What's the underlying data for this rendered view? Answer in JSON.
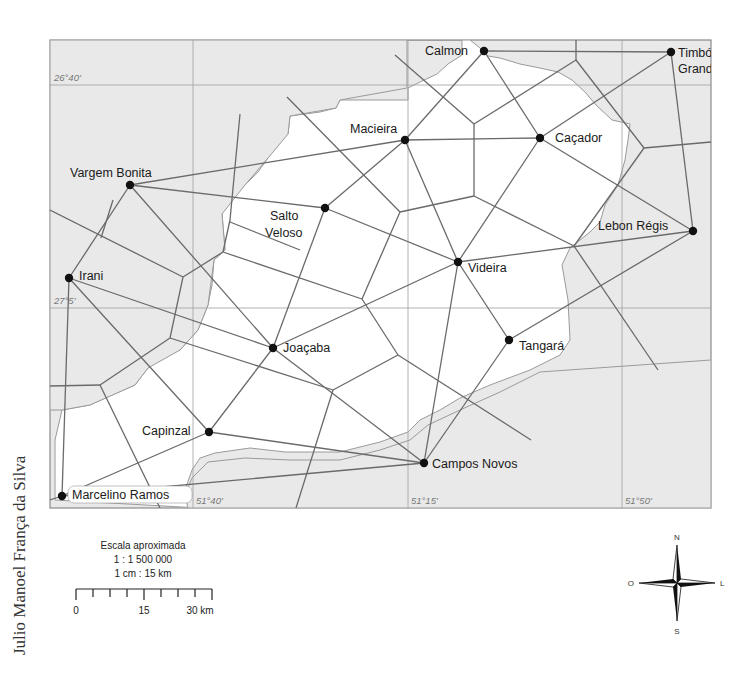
{
  "figure": {
    "top_fragment": "●",
    "author": "Julio Manoel França da Silva"
  },
  "map": {
    "colors": {
      "outside_region": "#e9e9e9",
      "inside_region": "#ffffff",
      "lines": "#6a6a6a",
      "grid": "#9a9a9a",
      "city_dot": "#111111"
    },
    "grid_labels": {
      "lat_top": "26°40'",
      "lat_mid": "27°5'",
      "lon_left": "51°40'",
      "lon_mid": "51°15'",
      "lon_right": "51°50'"
    },
    "cities": [
      {
        "name": "Calmon",
        "label": "Calmon"
      },
      {
        "name": "Timbó Grande",
        "label_line1": "Timbó",
        "label_line2": "Grande"
      },
      {
        "name": "Macieira",
        "label": "Macieira"
      },
      {
        "name": "Caçador",
        "label": "Caçador"
      },
      {
        "name": "Vargem Bonita",
        "label": "Vargem Bonita"
      },
      {
        "name": "Salto Veloso",
        "label_line1": "Salto",
        "label_line2": "Veloso"
      },
      {
        "name": "Lebon Régis",
        "label": "Lebon Régis"
      },
      {
        "name": "Videira",
        "label": "Videira"
      },
      {
        "name": "Irani",
        "label": "Irani"
      },
      {
        "name": "Joaçaba",
        "label": "Joaçaba"
      },
      {
        "name": "Tangará",
        "label": "Tangará"
      },
      {
        "name": "Capinzal",
        "label": "Capinzal"
      },
      {
        "name": "Campos Novos",
        "label": "Campos Novos"
      },
      {
        "name": "Marcelino Ramos",
        "label": "Marcelino Ramos"
      }
    ]
  },
  "scale": {
    "title": "Escala aproximada",
    "ratio": "1 : 1 500 000",
    "equivalence": "1 cm : 15 km",
    "tick_0": "0",
    "tick_15": "15",
    "tick_30": "30 km"
  },
  "compass": {
    "north": "N",
    "south": "S",
    "east": "L",
    "west": "O"
  }
}
